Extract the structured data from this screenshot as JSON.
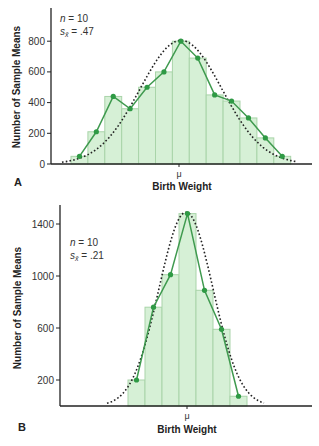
{
  "chart_data": [
    {
      "panel": "A",
      "type": "bar",
      "overlay": [
        "line (frequency polygon)",
        "dotted normal curve"
      ],
      "title": "",
      "annotation": {
        "n": "n = 10",
        "se": "s̄x = .47",
        "n_value": 10,
        "se_value": 0.47
      },
      "xlabel": "Birth Weight",
      "x_center_label": "μ",
      "ylabel": "Number of Sample Means",
      "yticks": [
        0,
        200,
        400,
        600,
        800
      ],
      "ylim": [
        0,
        1000
      ],
      "categories": [
        1,
        2,
        3,
        4,
        5,
        6,
        7,
        8,
        9,
        10,
        11,
        12,
        13
      ],
      "values": [
        50,
        210,
        440,
        360,
        500,
        600,
        800,
        690,
        450,
        410,
        300,
        170,
        50
      ],
      "grid": false
    },
    {
      "panel": "B",
      "type": "bar",
      "overlay": [
        "line (frequency polygon)",
        "dotted normal curve"
      ],
      "title": "",
      "annotation": {
        "n": "n = 10",
        "se": "s̄x = .21",
        "n_value": 10,
        "se_value": 0.21
      },
      "xlabel": "Birth Weight",
      "x_center_label": "μ",
      "ylabel": "Number of Sample Means",
      "yticks": [
        200,
        600,
        1000,
        1400
      ],
      "ylim": [
        0,
        1550
      ],
      "categories": [
        1,
        2,
        3,
        4,
        5,
        6,
        7
      ],
      "values": [
        200,
        760,
        1010,
        1480,
        890,
        590,
        75
      ],
      "grid": false
    }
  ],
  "labels": {
    "panel_a": "A",
    "panel_b": "B",
    "ylabel": "Number of Sample Means",
    "xlabel": "Birth Weight",
    "mu": "μ",
    "a_n": "n = 10",
    "a_se_prefix": "s",
    "a_se_value": " = .47",
    "b_n": "n = 10",
    "b_se_prefix": "s",
    "b_se_value": " = .21",
    "a_ticks": [
      "0",
      "200",
      "400",
      "600",
      "800"
    ],
    "b_ticks": [
      "200",
      "600",
      "1000",
      "1400"
    ]
  },
  "colors": {
    "bar_fill": "#d6f0d6",
    "bar_stroke": "#a9d4a9",
    "line": "#3f9a4f",
    "marker": "#2f9a45",
    "curve": "#222222",
    "axis": "#222222"
  }
}
